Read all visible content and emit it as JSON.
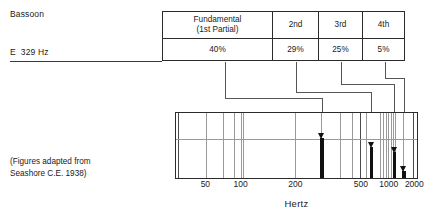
{
  "figure": {
    "instrument": "Bassoon",
    "pitch": "E  329 Hz",
    "source_note": "(Figures adapted from\nSeashore C.E. 1938)"
  },
  "table": {
    "columns": [
      {
        "header": "Fundamental\n(1st Partial)",
        "value": "40%"
      },
      {
        "header": "2nd",
        "value": "29%"
      },
      {
        "header": "3rd",
        "value": "25%"
      },
      {
        "header": "4th",
        "value": "5%"
      }
    ]
  },
  "axis": {
    "title": "Hertz",
    "ticks": [
      {
        "label": "50",
        "pos_pct": 12.5
      },
      {
        "label": "100",
        "pos_pct": 27.0
      },
      {
        "label": "200",
        "pos_pct": 49.5
      },
      {
        "label": "500",
        "pos_pct": 76.5
      },
      {
        "label": "1000",
        "pos_pct": 88.0
      },
      {
        "label": "2000",
        "pos_pct": 98.5
      }
    ]
  },
  "chart_data": {
    "type": "bar",
    "xlabel": "Hertz",
    "ylabel": "",
    "x_scale": "log",
    "xlim": [
      40,
      2200
    ],
    "grid": true,
    "legend": false,
    "categories": [
      "Fundamental (1st Partial)",
      "2nd",
      "3rd",
      "4th"
    ],
    "frequencies_hz": [
      329,
      658,
      987,
      1316
    ],
    "values": [
      40,
      29,
      25,
      5
    ],
    "value_unit": "%",
    "bars": [
      {
        "partial": "Fundamental (1st Partial)",
        "frequency_hz": 329,
        "amplitude_pct": 40,
        "x_pct": 60.5,
        "height_pct": 62,
        "width_px": 4
      },
      {
        "partial": "2nd",
        "frequency_hz": 658,
        "amplitude_pct": 29,
        "x_pct": 81.0,
        "height_pct": 47,
        "width_px": 3
      },
      {
        "partial": "3rd",
        "frequency_hz": 987,
        "amplitude_pct": 25,
        "x_pct": 90.5,
        "height_pct": 40,
        "width_px": 3
      },
      {
        "partial": "4th",
        "frequency_hz": 1316,
        "amplitude_pct": 5,
        "x_pct": 94.5,
        "height_pct": 11,
        "width_px": 4
      }
    ],
    "gridlines_pct": [
      1.0,
      12.5,
      19.5,
      24.0,
      27.0,
      27.8,
      49.5,
      60.2,
      68.0,
      73.0,
      76.5,
      79.0,
      84.5,
      86.0,
      87.3,
      88.0,
      89.2,
      90.0,
      91.0,
      94.0,
      98.5
    ],
    "decade_gridlines_pct": [
      1.0,
      27.4,
      76.5,
      98.5
    ]
  }
}
